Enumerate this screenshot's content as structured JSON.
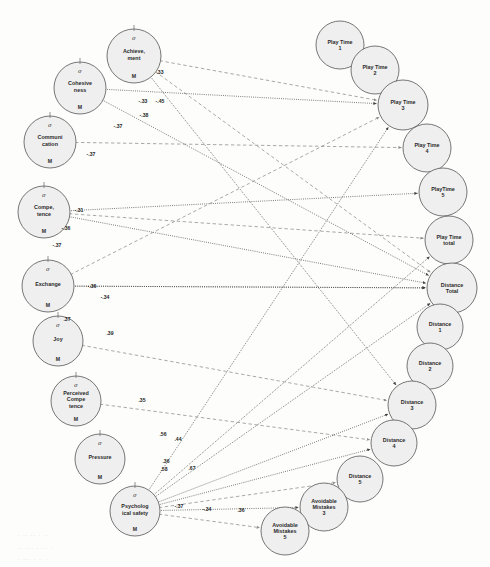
{
  "figure": {
    "type": "path-diagram",
    "node_fill": "#efefef",
    "node_stroke": "#555555",
    "positive_edge_color": "#3a3a3a",
    "negative_edge_color": "#6e6e6e",
    "latent_marker_top": "σ",
    "latent_marker_bottom": "M"
  },
  "nodes": [
    {
      "id": "achievement",
      "label": "Achieve, ment",
      "lines": [
        "Achieve,",
        "ment"
      ],
      "x": 134,
      "y": 56,
      "r": 27,
      "latent": true
    },
    {
      "id": "cohesiveness",
      "label": "Cohesive ness",
      "lines": [
        "Cohesive",
        "ness"
      ],
      "x": 80,
      "y": 88,
      "r": 26,
      "latent": true
    },
    {
      "id": "communication",
      "label": "Communi cation",
      "lines": [
        "Communi",
        "cation"
      ],
      "x": 50,
      "y": 142,
      "r": 26,
      "latent": true
    },
    {
      "id": "competence",
      "label": "Compe, tence",
      "lines": [
        "Compe,",
        "tence"
      ],
      "x": 44,
      "y": 212,
      "r": 26,
      "latent": true
    },
    {
      "id": "exchange",
      "label": "Exchange",
      "lines": [
        "Exchange"
      ],
      "x": 48,
      "y": 286,
      "r": 26,
      "latent": true
    },
    {
      "id": "joy",
      "label": "Joy",
      "lines": [
        "Joy"
      ],
      "x": 58,
      "y": 341,
      "r": 25,
      "latent": true
    },
    {
      "id": "perceived_competence",
      "label": "Perceived Compe tence",
      "lines": [
        "Perceived",
        "Compe",
        "tence"
      ],
      "x": 76,
      "y": 401,
      "r": 25,
      "latent": true
    },
    {
      "id": "pressure",
      "label": "Pressure",
      "lines": [
        "Pressure"
      ],
      "x": 100,
      "y": 459,
      "r": 25,
      "latent": true
    },
    {
      "id": "psych_safety",
      "label": "Psycholog ical safety",
      "lines": [
        "Psycholog",
        "ical safety"
      ],
      "x": 135,
      "y": 511,
      "r": 25,
      "latent": true
    },
    {
      "id": "play_time_1",
      "label": "Play Time 1",
      "lines": [
        "Play Time",
        "1"
      ],
      "x": 340,
      "y": 45,
      "r": 24,
      "latent": false
    },
    {
      "id": "play_time_2",
      "label": "Play Time 2",
      "lines": [
        "Play Time",
        "2"
      ],
      "x": 375,
      "y": 70,
      "r": 24,
      "latent": false
    },
    {
      "id": "play_time_3",
      "label": "Play Time 3",
      "lines": [
        "Play Time",
        "3"
      ],
      "x": 403,
      "y": 105,
      "r": 25,
      "latent": false
    },
    {
      "id": "play_time_4",
      "label": "Play Time 4",
      "lines": [
        "Play Time",
        "4"
      ],
      "x": 427,
      "y": 148,
      "r": 24,
      "latent": false
    },
    {
      "id": "play_time_5",
      "label": "PlayTime 5",
      "lines": [
        "PlayTime",
        "5"
      ],
      "x": 443,
      "y": 192,
      "r": 24,
      "latent": false
    },
    {
      "id": "play_time_total",
      "label": "Play Time total",
      "lines": [
        "Play Time",
        "total"
      ],
      "x": 449,
      "y": 240,
      "r": 24,
      "latent": false
    },
    {
      "id": "distance_total",
      "label": "Distance Total",
      "lines": [
        "Distance",
        "Total"
      ],
      "x": 452,
      "y": 288,
      "r": 25,
      "latent": false
    },
    {
      "id": "distance_1",
      "label": "Distance 1",
      "lines": [
        "Distance",
        "1"
      ],
      "x": 440,
      "y": 327,
      "r": 23,
      "latent": false
    },
    {
      "id": "distance_2",
      "label": "Distance 2",
      "lines": [
        "Distance",
        "2"
      ],
      "x": 430,
      "y": 366,
      "r": 23,
      "latent": false
    },
    {
      "id": "distance_3",
      "label": "Distance 3",
      "lines": [
        "Distance",
        "3"
      ],
      "x": 412,
      "y": 405,
      "r": 24,
      "latent": false
    },
    {
      "id": "distance_4",
      "label": "Distance 4",
      "lines": [
        "Distance",
        "4"
      ],
      "x": 394,
      "y": 443,
      "r": 23,
      "latent": false
    },
    {
      "id": "distance_5",
      "label": "Distance 5",
      "lines": [
        "Distance",
        "5"
      ],
      "x": 360,
      "y": 479,
      "r": 23,
      "latent": false
    },
    {
      "id": "avoidable_mistakes_3",
      "label": "Avoidable Mistakes 3",
      "lines": [
        "Avoidable",
        "Mistakes",
        "3"
      ],
      "x": 324,
      "y": 507,
      "r": 24,
      "latent": false
    },
    {
      "id": "avoidable_mistakes_5",
      "label": "Avoidable Mistakes 5",
      "lines": [
        "Avoidable",
        "Mistakes",
        "5"
      ],
      "x": 285,
      "y": 531,
      "r": 24,
      "latent": false
    }
  ],
  "edges": [
    {
      "from": "achievement",
      "to": "play_time_3",
      "weight": ".33",
      "sign": "neg",
      "lx": 160,
      "ly": 74
    },
    {
      "from": "achievement",
      "to": "distance_total",
      "weight": "-.45",
      "sign": "neg",
      "lx": 160,
      "ly": 103
    },
    {
      "from": "achievement",
      "to": "distance_3",
      "weight": "-.33",
      "sign": "pos",
      "lx": 143,
      "ly": 103
    },
    {
      "from": "cohesiveness",
      "to": "play_time_3",
      "weight": "-.38",
      "sign": "pos",
      "lx": 144,
      "ly": 117
    },
    {
      "from": "cohesiveness",
      "to": "distance_total",
      "weight": "-.37",
      "sign": "pos",
      "lx": 118,
      "ly": 128
    },
    {
      "from": "communication",
      "to": "play_time_4",
      "weight": "-.37",
      "sign": "neg",
      "lx": 91,
      "ly": 156
    },
    {
      "from": "competence",
      "to": "play_time_5",
      "weight": "-.31",
      "sign": "pos",
      "lx": 79,
      "ly": 212
    },
    {
      "from": "competence",
      "to": "play_time_total",
      "weight": "-.36",
      "sign": "neg",
      "lx": 66,
      "ly": 230
    },
    {
      "from": "competence",
      "to": "distance_total",
      "weight": "-.37",
      "sign": "pos",
      "lx": 57,
      "ly": 247
    },
    {
      "from": "exchange",
      "to": "distance_total",
      "weight": "-.36",
      "sign": "pos",
      "lx": 92,
      "ly": 288
    },
    {
      "from": "exchange",
      "to": "distance_total",
      "weight": "-.34",
      "sign": "pos",
      "lx": 105,
      "ly": 299
    },
    {
      "from": "exchange",
      "to": "play_time_3",
      "weight": ".37",
      "sign": "neg",
      "lx": 67,
      "ly": 321
    },
    {
      "from": "joy",
      "to": "distance_3",
      "weight": ".39",
      "sign": "neg",
      "lx": 110,
      "ly": 335
    },
    {
      "from": "perceived_competence",
      "to": "distance_4",
      "weight": ".35",
      "sign": "neg",
      "lx": 142,
      "ly": 402
    },
    {
      "from": "psych_safety",
      "to": "play_time_3",
      "weight": ".56",
      "sign": "pos",
      "lx": 163,
      "ly": 436
    },
    {
      "from": "psych_safety",
      "to": "play_time_total",
      "weight": ".44",
      "sign": "pos",
      "lx": 178,
      "ly": 441
    },
    {
      "from": "psych_safety",
      "to": "distance_total",
      "weight": ".36",
      "sign": "pos",
      "lx": 166,
      "ly": 463
    },
    {
      "from": "psych_safety",
      "to": "distance_3",
      "weight": ".58",
      "sign": "pos",
      "lx": 164,
      "ly": 471
    },
    {
      "from": "psych_safety",
      "to": "distance_4",
      "weight": ".67",
      "sign": "pos",
      "lx": 192,
      "ly": 470
    },
    {
      "from": "psych_safety",
      "to": "distance_5",
      "weight": "-.37",
      "sign": "neg",
      "lx": 179,
      "ly": 508
    },
    {
      "from": "psych_safety",
      "to": "avoidable_mistakes_3",
      "weight": "-.34",
      "sign": "pos",
      "lx": 207,
      "ly": 511
    },
    {
      "from": "psych_safety",
      "to": "avoidable_mistakes_5",
      "weight": ".36",
      "sign": "neg",
      "lx": 241,
      "ly": 512
    }
  ],
  "background_noise": [
    {
      "text": "· ·· ·· · ··",
      "x": 18,
      "y": 532
    },
    {
      "text": "·· ··· · ··· ·",
      "x": 18,
      "y": 545
    },
    {
      "text": "· ··· · ·· ·",
      "x": 18,
      "y": 556
    }
  ]
}
